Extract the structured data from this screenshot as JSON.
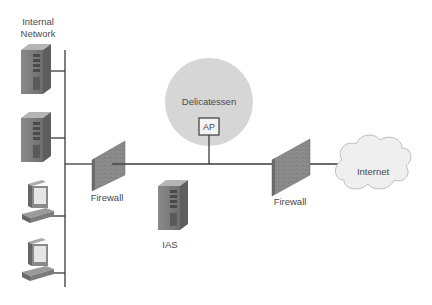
{
  "diagram": {
    "labels": {
      "internal_network_line1": "Internal",
      "internal_network_line2": "Network",
      "delicatessen": "Delicatessen",
      "ap": "AP",
      "firewall_left": "Firewall",
      "firewall_right": "Firewall",
      "ias": "IAS",
      "internet": "Internet"
    },
    "nodes": [
      {
        "id": "server-1",
        "type": "server-icon",
        "group": "internal-network"
      },
      {
        "id": "server-2",
        "type": "server-icon",
        "group": "internal-network"
      },
      {
        "id": "workstation-1",
        "type": "computer-icon",
        "group": "internal-network"
      },
      {
        "id": "workstation-2",
        "type": "computer-icon",
        "group": "internal-network"
      },
      {
        "id": "firewall-left",
        "type": "firewall-icon"
      },
      {
        "id": "ap",
        "type": "access-point"
      },
      {
        "id": "ias",
        "type": "server-icon"
      },
      {
        "id": "firewall-right",
        "type": "firewall-icon"
      },
      {
        "id": "internet",
        "type": "cloud-icon"
      }
    ],
    "colors": {
      "line": "#3a3a3a",
      "zone_circle": "#d4d4d4",
      "firewall": "#8a8a8a",
      "server": "#7a7a7a",
      "cloud": "#eeeeee"
    }
  }
}
